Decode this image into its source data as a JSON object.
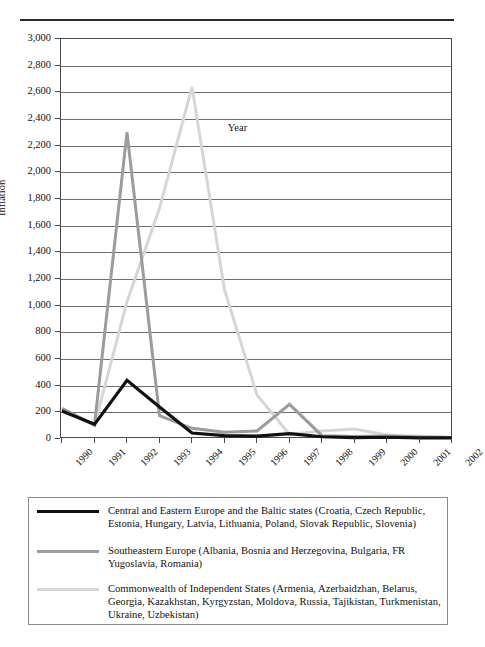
{
  "figure": {
    "axis_title_y": "Inflation",
    "axis_title_x": "Year"
  },
  "chart_data": {
    "type": "line",
    "title": "",
    "xlabel": "Year",
    "ylabel": "Inflation",
    "x": [
      1990,
      1991,
      1992,
      1993,
      1994,
      1995,
      1996,
      1997,
      1998,
      1999,
      2000,
      2001,
      2002
    ],
    "xlim": [
      1990,
      2002
    ],
    "ylim": [
      0,
      3000
    ],
    "ytick_step": 200,
    "grid": true,
    "legend_position": "below-plot",
    "yticks": [
      "3,000",
      "2,800",
      "2,600",
      "2,400",
      "2,200",
      "2,000",
      "1,800",
      "1,600",
      "1,400",
      "1,200",
      "1,000",
      "800",
      "600",
      "400",
      "200",
      "0"
    ],
    "xticks": [
      "1990",
      "1991",
      "1992",
      "1993",
      "1994",
      "1995",
      "1996",
      "1997",
      "1998",
      "1999",
      "2000",
      "2001",
      "2002"
    ],
    "series": [
      {
        "name": "Central and Eastern Europe and the Baltic states (Croatia, Czech Republic, Estonia, Hungary, Latvia, Lithuania, Poland, Slovak Republic, Slovenia)",
        "short_name": "Central and Eastern Europe and the Baltic states",
        "color": "#111111",
        "width": 3.2,
        "values": [
          210,
          110,
          440,
          240,
          45,
          25,
          22,
          40,
          17,
          11,
          13,
          9,
          8
        ]
      },
      {
        "name": "Southeastern Europe (Albania, Bosnia and Herzegovina, Bulgaria, FR Yugoslavia, Romania)",
        "short_name": "Southeastern Europe",
        "color": "#9c9c9c",
        "width": 3.0,
        "values": [
          230,
          105,
          2300,
          175,
          80,
          50,
          60,
          260,
          25,
          18,
          22,
          15,
          12
        ]
      },
      {
        "name": "Commonwealth of Independent States (Armenia, Azerbaidzhan, Belarus, Georgia, Kazakhstan, Kyrgyzstan, Moldova, Russia, Tajikistan, Turkmenistan, Ukraine, Uzbekistan)",
        "short_name": "Commonwealth of Independent States",
        "color": "#d6d6d6",
        "width": 3.0,
        "values": [
          225,
          100,
          1030,
          1730,
          2640,
          1120,
          330,
          35,
          60,
          75,
          30,
          20,
          14
        ]
      }
    ]
  },
  "legend": [
    {
      "swatch_color": "#111111",
      "swatch_width": 3.4,
      "text": "Central and Eastern Europe and the Baltic states (Croatia, Czech Republic, Estonia, Hungary, Latvia, Lithuania, Poland, Slovak Republic, Slovenia)"
    },
    {
      "swatch_color": "#9c9c9c",
      "swatch_width": 3.0,
      "text": "Southeastern Europe (Albania, Bosnia and Herzegovina, Bulgaria, FR Yugoslavia, Romania)"
    },
    {
      "swatch_color": "#d6d6d6",
      "swatch_width": 3.0,
      "text": "Commonwealth of Independent States (Armenia, Azerbaidzhan, Belarus, Georgia, Kazakhstan, Kyrgyzstan, Moldova, Russia, Tajikistan, Turkmenistan, Ukraine, Uzbekistan)"
    }
  ]
}
